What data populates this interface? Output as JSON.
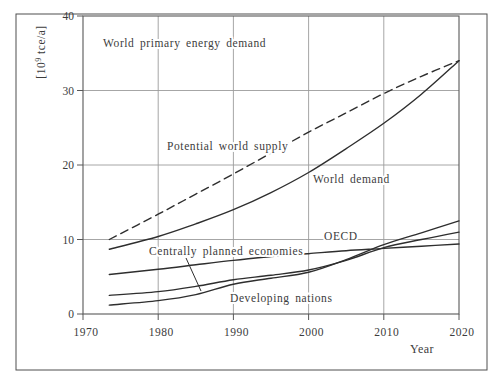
{
  "figure": {
    "border_color": "#4f4f4f"
  },
  "chart_data": {
    "type": "line",
    "title": "World primary energy demand",
    "xlabel": "Year",
    "ylabel": "[10⁹ tce/a]",
    "xlim": [
      1970,
      2020
    ],
    "ylim": [
      0,
      40
    ],
    "x_ticks": [
      1970,
      1980,
      1990,
      2000,
      2010,
      2020
    ],
    "y_ticks": [
      0,
      10,
      20,
      30,
      40
    ],
    "grid": true,
    "legend_position": "inline-labels",
    "x": [
      1973.5,
      1980,
      1985,
      1990,
      1995,
      2000,
      2005,
      2010,
      2015,
      2020
    ],
    "series": [
      {
        "name": "Potential world supply",
        "style": "dashed",
        "values": [
          10.0,
          13.4,
          16.1,
          18.8,
          21.6,
          24.4,
          27.0,
          29.6,
          31.9,
          34.0
        ]
      },
      {
        "name": "World demand",
        "style": "solid",
        "values": [
          8.7,
          10.4,
          12.1,
          14.0,
          16.3,
          19.0,
          22.2,
          25.6,
          29.5,
          34.0
        ]
      },
      {
        "name": "OECD",
        "style": "solid",
        "values": [
          5.3,
          6.0,
          6.6,
          7.2,
          7.7,
          8.1,
          8.5,
          8.8,
          9.1,
          9.4
        ]
      },
      {
        "name": "Centrally planned economies",
        "style": "solid",
        "values": [
          2.5,
          3.0,
          3.7,
          4.6,
          5.2,
          5.9,
          7.2,
          8.9,
          10.0,
          11.0
        ]
      },
      {
        "name": "Developing nations",
        "style": "solid",
        "values": [
          1.2,
          1.8,
          2.6,
          4.0,
          4.8,
          5.6,
          7.3,
          9.3,
          10.9,
          12.5
        ]
      }
    ],
    "annotations": [
      {
        "id": "chart-title",
        "text": "World primary energy demand",
        "px": [
          103,
          43
        ]
      },
      {
        "id": "label-potential-world-supply",
        "text": "Potential world supply",
        "px": [
          167,
          146
        ]
      },
      {
        "id": "label-world-demand",
        "text": "World demand",
        "px": [
          313,
          179
        ]
      },
      {
        "id": "label-oecd",
        "text": "OECD",
        "px": [
          324,
          236
        ]
      },
      {
        "id": "label-centrally-planned-economies",
        "text": "Centrally planned economies",
        "px": [
          149,
          251
        ],
        "leader": [
          [
            186,
            258
          ],
          [
            201,
            291
          ]
        ]
      },
      {
        "id": "label-developing-nations",
        "text": "Developing nations",
        "px": [
          230,
          298
        ]
      }
    ],
    "colors": {
      "line": "#2e2e2e",
      "grid": "#9c9c9c",
      "axis": "#585858",
      "text": "#3c3c3c",
      "background": "#ffffff"
    }
  }
}
